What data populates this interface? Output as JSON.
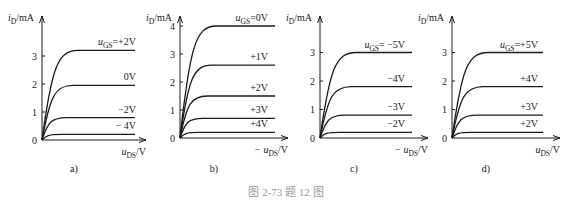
{
  "caption": "图 2-73   题 12 图",
  "chart_data": [
    {
      "type": "line",
      "panel_label": "a)",
      "ylabel": "i_D/mA",
      "xlabel": "u_DS/V",
      "xlabel_sign": "",
      "ylim": [
        0,
        4
      ],
      "yticks": [
        0,
        1,
        2,
        3
      ],
      "series": [
        {
          "name": "u_GS=+2V",
          "label": "uGS=+2V",
          "saturation_current": 3.2
        },
        {
          "name": "0V",
          "label": "0V",
          "saturation_current": 1.95
        },
        {
          "name": "-2V",
          "label": "−2V",
          "saturation_current": 0.8
        },
        {
          "name": "-4V",
          "label": "− 4V",
          "saturation_current": 0.2
        }
      ]
    },
    {
      "type": "line",
      "panel_label": "b)",
      "ylabel": "i_D/mA",
      "xlabel": "u_DS/V",
      "xlabel_sign": "−",
      "ylim": [
        0,
        4
      ],
      "yticks": [
        0,
        1,
        2,
        3,
        4
      ],
      "series": [
        {
          "name": "u_GS=0V",
          "label": "uGS=0V",
          "saturation_current": 4.0
        },
        {
          "name": "+1V",
          "label": "+1V",
          "saturation_current": 2.6
        },
        {
          "name": "+2V",
          "label": "+2V",
          "saturation_current": 1.5
        },
        {
          "name": "+3V",
          "label": "+3V",
          "saturation_current": 0.7
        },
        {
          "name": "+4V",
          "label": "+4V",
          "saturation_current": 0.2
        }
      ]
    },
    {
      "type": "line",
      "panel_label": "c)",
      "ylabel": "i_D/mA",
      "xlabel": "u_DS/V",
      "xlabel_sign": "−",
      "ylim": [
        0,
        4
      ],
      "yticks": [
        0,
        1,
        2,
        3
      ],
      "series": [
        {
          "name": "u_GS=-5V",
          "label": "uGS= −5V",
          "saturation_current": 3.0
        },
        {
          "name": "-4V",
          "label": "−4V",
          "saturation_current": 1.8
        },
        {
          "name": "-3V",
          "label": "−3V",
          "saturation_current": 0.8
        },
        {
          "name": "-2V",
          "label": "−2V",
          "saturation_current": 0.2
        }
      ]
    },
    {
      "type": "line",
      "panel_label": "d)",
      "ylabel": "i_D/mA",
      "xlabel": "u_DS/V",
      "xlabel_sign": "",
      "ylim": [
        0,
        4
      ],
      "yticks": [
        0,
        1,
        2,
        3
      ],
      "series": [
        {
          "name": "u_GS=+5V",
          "label": "uGS=+5V",
          "saturation_current": 3.0
        },
        {
          "name": "+4V",
          "label": "+4V",
          "saturation_current": 1.8
        },
        {
          "name": "+3V",
          "label": "+3V",
          "saturation_current": 0.8
        },
        {
          "name": "+2V",
          "label": "+2V",
          "saturation_current": 0.2
        }
      ]
    }
  ]
}
